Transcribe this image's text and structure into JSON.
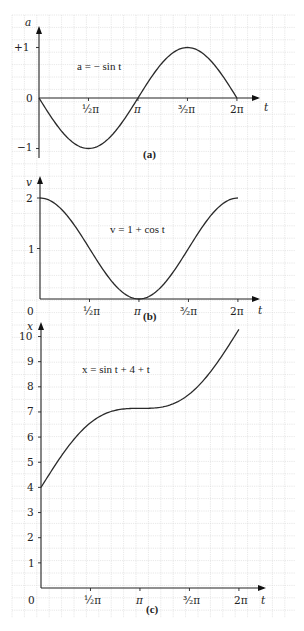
{
  "grid": {
    "x0": 12,
    "x1": 295,
    "y0": 15,
    "y1": 618,
    "step": 12.4,
    "color": "#d6d6d6"
  },
  "chart_data": [
    {
      "id": "a",
      "type": "line",
      "title": "a = − sin t",
      "panel_label": "(a)",
      "xlabel": "t",
      "ylabel": "a",
      "x_ticks": [
        "½π",
        "π",
        "³⁄₂π",
        "2π"
      ],
      "y_ticks": [
        "+1",
        "0",
        "−1"
      ],
      "ylim": [
        -1.3,
        1.3
      ],
      "xlim": [
        0,
        6.2832
      ],
      "function": "-sin(t)",
      "x": [
        0,
        0.785,
        1.571,
        2.356,
        3.142,
        3.927,
        4.712,
        5.498,
        6.283
      ],
      "values": [
        0,
        -0.707,
        -1,
        -0.707,
        0,
        0.707,
        1,
        0.707,
        0
      ]
    },
    {
      "id": "b",
      "type": "line",
      "title": "v = 1 + cos t",
      "panel_label": "(b)",
      "xlabel": "t",
      "ylabel": "v",
      "x_ticks": [
        "0",
        "½π",
        "π",
        "³⁄₂π",
        "2π"
      ],
      "y_ticks": [
        "2",
        "1"
      ],
      "ylim": [
        0,
        2.3
      ],
      "xlim": [
        0,
        6.2832
      ],
      "function": "1+cos(t)",
      "x": [
        0,
        0.785,
        1.571,
        2.356,
        3.142,
        3.927,
        4.712,
        5.498,
        6.283
      ],
      "values": [
        2,
        1.707,
        1,
        0.293,
        0,
        0.293,
        1,
        1.707,
        2
      ]
    },
    {
      "id": "c",
      "type": "line",
      "title": "x = sin t + 4 + t",
      "panel_label": "(c)",
      "xlabel": "t",
      "ylabel": "x",
      "x_ticks": [
        "0",
        "½π",
        "π",
        "³⁄₂π",
        "2π"
      ],
      "y_ticks": [
        "10",
        "9",
        "8",
        "7",
        "6",
        "5",
        "4",
        "3",
        "2",
        "1"
      ],
      "ylim": [
        0,
        10.5
      ],
      "xlim": [
        0,
        6.2832
      ],
      "function": "sin(t)+4+t",
      "x": [
        0,
        0.785,
        1.571,
        2.356,
        3.142,
        3.927,
        4.712,
        5.498,
        6.283
      ],
      "values": [
        4,
        5.492,
        6.571,
        7.063,
        7.142,
        7.22,
        7.712,
        8.791,
        10.283
      ]
    }
  ],
  "layout": {
    "a": {
      "ox": 39,
      "oy": 98,
      "xscale": 31.5,
      "yscale": 50.5,
      "ytop": 28,
      "ybot": 158,
      "xend": 258
    },
    "b": {
      "ox": 40,
      "oy": 299,
      "xscale": 31.5,
      "yscale": 50.5,
      "ytop": 178,
      "xend": 258
    },
    "c": {
      "ox": 41,
      "oy": 588,
      "xscale": 31.5,
      "yscale": 25.15,
      "ytop": 324,
      "xend": 264
    }
  }
}
